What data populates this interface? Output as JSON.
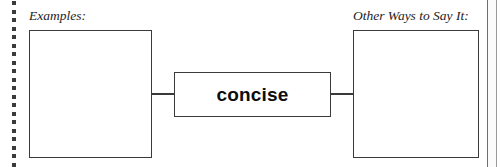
{
  "worksheet": {
    "type": "word-map-graphic-organizer",
    "center_term": "concise",
    "left_field": {
      "caption": "Examples:",
      "value": ""
    },
    "right_field": {
      "caption": "Other Ways to Say It:",
      "value": ""
    },
    "binding": {
      "icon": "dotted-binding-holes",
      "dot_count": 20,
      "dot_spacing_px": 8.5,
      "dot_color": "#3b3b3b"
    },
    "page_edge": {
      "icon": "page-edge-line",
      "color": "#8c8c8c"
    },
    "colors": {
      "background": "#ffffff",
      "line": "#3a3a3a",
      "text": "#1d1d1d",
      "term_text": "#0d0d0d"
    }
  }
}
